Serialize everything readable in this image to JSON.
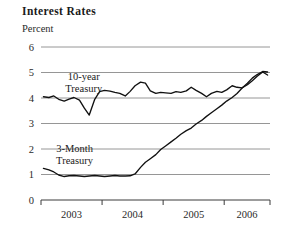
{
  "chart_data": {
    "type": "line",
    "title": "Interest Rates",
    "ylabel": "Percent",
    "xlabel": "",
    "ylim": [
      0,
      6
    ],
    "yticks": [
      0,
      1,
      2,
      3,
      4,
      5,
      6
    ],
    "ytick_labels": [
      "0",
      "1",
      "2",
      "3",
      "4",
      "5",
      "6"
    ],
    "grid": true,
    "grid_axis": "y",
    "legend_position": "inline-annotations",
    "xlim": [
      2002.75,
      2006.5
    ],
    "xtick_positions": [
      2002.75,
      2003.75,
      2004.75,
      2005.75,
      2006.5
    ],
    "categories": [
      "2003",
      "2004",
      "2005",
      "2006"
    ],
    "xtick_labels": [
      "2003",
      "2004",
      "2005",
      "2006"
    ],
    "line_color": "#111111",
    "grid_color": "#8a8a8a",
    "axis_color": "#555555",
    "series": [
      {
        "name": "10-year Treasury",
        "label": "10-year\nTreasury",
        "label_line1": "10-year",
        "label_line2": "Treasury",
        "x": [
          2002.79,
          2002.88,
          2002.96,
          2003.04,
          2003.13,
          2003.21,
          2003.29,
          2003.38,
          2003.46,
          2003.54,
          2003.63,
          2003.71,
          2003.79,
          2003.88,
          2003.96,
          2004.04,
          2004.13,
          2004.21,
          2004.29,
          2004.38,
          2004.46,
          2004.54,
          2004.63,
          2004.71,
          2004.79,
          2004.88,
          2004.96,
          2005.04,
          2005.13,
          2005.21,
          2005.29,
          2005.38,
          2005.46,
          2005.54,
          2005.63,
          2005.71,
          2005.79,
          2005.88,
          2005.96,
          2006.04,
          2006.13,
          2006.21,
          2006.29,
          2006.38,
          2006.46
        ],
        "values": [
          4.05,
          4.02,
          4.08,
          3.95,
          3.88,
          3.96,
          4.02,
          3.92,
          3.6,
          3.33,
          3.95,
          4.25,
          4.3,
          4.27,
          4.22,
          4.18,
          4.08,
          4.26,
          4.48,
          4.62,
          4.58,
          4.28,
          4.18,
          4.22,
          4.2,
          4.18,
          4.25,
          4.22,
          4.28,
          4.42,
          4.3,
          4.18,
          4.05,
          4.18,
          4.26,
          4.22,
          4.32,
          4.48,
          4.42,
          4.4,
          4.52,
          4.68,
          4.85,
          5.02,
          4.9
        ]
      },
      {
        "name": "3-Month Treasury",
        "label": "3-Month\nTreasury",
        "label_line1": "3-Month",
        "label_line2": "Treasury",
        "x": [
          2002.79,
          2002.88,
          2002.96,
          2003.04,
          2003.13,
          2003.21,
          2003.29,
          2003.38,
          2003.46,
          2003.54,
          2003.63,
          2003.71,
          2003.79,
          2003.88,
          2003.96,
          2004.04,
          2004.13,
          2004.21,
          2004.29,
          2004.38,
          2004.46,
          2004.54,
          2004.63,
          2004.71,
          2004.79,
          2004.88,
          2004.96,
          2005.04,
          2005.13,
          2005.21,
          2005.29,
          2005.38,
          2005.46,
          2005.54,
          2005.63,
          2005.71,
          2005.79,
          2005.88,
          2005.96,
          2006.04,
          2006.13,
          2006.21,
          2006.29,
          2006.38,
          2006.46
        ],
        "values": [
          1.24,
          1.18,
          1.1,
          0.98,
          0.92,
          0.95,
          0.96,
          0.94,
          0.92,
          0.94,
          0.96,
          0.94,
          0.92,
          0.94,
          0.96,
          0.94,
          0.94,
          0.95,
          1.02,
          1.28,
          1.48,
          1.62,
          1.78,
          1.98,
          2.12,
          2.28,
          2.42,
          2.58,
          2.72,
          2.82,
          2.98,
          3.12,
          3.28,
          3.42,
          3.58,
          3.72,
          3.88,
          4.02,
          4.18,
          4.38,
          4.58,
          4.78,
          4.92,
          5.04,
          5.02
        ]
      }
    ],
    "annotations": [
      {
        "text": "10-year Treasury",
        "x": 2003.45,
        "y": 4.72
      },
      {
        "text": "3-Month Treasury",
        "x": 2003.3,
        "y": 1.88
      }
    ]
  }
}
